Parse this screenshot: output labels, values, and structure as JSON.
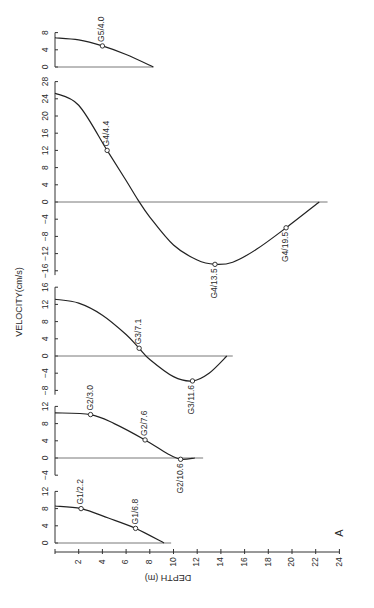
{
  "figure": {
    "panel_letter": "A",
    "velocity_axis_label": "VELOCITY(cm/s)",
    "depth_axis_label": "DEPTH (m)"
  },
  "chart_data": {
    "type": "line",
    "title": "",
    "xlabel": "DEPTH (m)",
    "ylabel": "VELOCITY(cm/s)",
    "orientation": "rotated 90° counter-clockwise; depth axis along bottom, velocity panels stacked",
    "depth_axis": {
      "range": [
        0,
        24
      ],
      "ticks": [
        2,
        4,
        6,
        8,
        10,
        12,
        14,
        16,
        18,
        20,
        22,
        24
      ]
    },
    "annotation": "A",
    "panels": [
      {
        "station": "G5",
        "velocity_ticks": [
          0,
          4,
          8
        ],
        "velocity_range": [
          0,
          8
        ],
        "curve": [
          [
            0,
            6.8
          ],
          [
            2,
            6.3
          ],
          [
            4,
            4.9
          ],
          [
            6,
            2.9
          ],
          [
            8.3,
            0
          ]
        ],
        "labeled_points": [
          {
            "label": "G5/4.0",
            "depth": 4.0,
            "velocity": 4.9
          }
        ]
      },
      {
        "station": "G4",
        "velocity_ticks": [
          -16,
          -12,
          -8,
          -4,
          0,
          4,
          8,
          12,
          16,
          20,
          24,
          28
        ],
        "velocity_range": [
          -17,
          28
        ],
        "curve": [
          [
            0,
            25.3
          ],
          [
            2,
            22.5
          ],
          [
            4.4,
            12
          ],
          [
            6,
            5
          ],
          [
            7,
            0.5
          ],
          [
            8,
            -3.5
          ],
          [
            10,
            -10
          ],
          [
            12,
            -13.5
          ],
          [
            13.5,
            -14.5
          ],
          [
            15,
            -14
          ],
          [
            17,
            -11
          ],
          [
            19.5,
            -6
          ],
          [
            22.3,
            0
          ]
        ],
        "labeled_points": [
          {
            "label": "G4/4.4",
            "depth": 4.4,
            "velocity": 12
          },
          {
            "label": "G4/13.5",
            "depth": 13.5,
            "velocity": -14.5
          },
          {
            "label": "G4/19.5",
            "depth": 19.5,
            "velocity": -6
          }
        ]
      },
      {
        "station": "G3",
        "velocity_ticks": [
          -8,
          -4,
          0,
          4,
          8,
          12,
          16
        ],
        "velocity_range": [
          -9,
          16
        ],
        "curve": [
          [
            0,
            13.2
          ],
          [
            2,
            12.3
          ],
          [
            4,
            9.5
          ],
          [
            6,
            5
          ],
          [
            7.1,
            1.8
          ],
          [
            8,
            -0.8
          ],
          [
            10,
            -4.8
          ],
          [
            11.6,
            -5.8
          ],
          [
            13,
            -4
          ],
          [
            14.5,
            0
          ]
        ],
        "labeled_points": [
          {
            "label": "G3/7.1",
            "depth": 7.1,
            "velocity": 1.8
          },
          {
            "label": "G3/11.6",
            "depth": 11.6,
            "velocity": -5.8
          }
        ]
      },
      {
        "station": "G2",
        "velocity_ticks": [
          -4,
          0,
          4,
          8,
          12
        ],
        "velocity_range": [
          -4,
          12
        ],
        "curve": [
          [
            0,
            10.5
          ],
          [
            3.0,
            10.1
          ],
          [
            5,
            8
          ],
          [
            7.6,
            4.2
          ],
          [
            9.5,
            1
          ],
          [
            10.6,
            -0.3
          ],
          [
            11.8,
            0
          ]
        ],
        "labeled_points": [
          {
            "label": "G2/3.0",
            "depth": 3.0,
            "velocity": 10.1
          },
          {
            "label": "G2/7.6",
            "depth": 7.6,
            "velocity": 4.2
          },
          {
            "label": "G2/10.6",
            "depth": 10.6,
            "velocity": -0.3
          }
        ]
      },
      {
        "station": "G1",
        "velocity_ticks": [
          0,
          4,
          8,
          12
        ],
        "velocity_range": [
          0,
          12
        ],
        "curve": [
          [
            0,
            8.6
          ],
          [
            2.2,
            8.0
          ],
          [
            4.5,
            5.8
          ],
          [
            6.8,
            3.4
          ],
          [
            9.2,
            0
          ]
        ],
        "labeled_points": [
          {
            "label": "G1/2.2",
            "depth": 2.2,
            "velocity": 8.0
          },
          {
            "label": "G1/6.8",
            "depth": 6.8,
            "velocity": 3.4
          }
        ]
      }
    ]
  }
}
